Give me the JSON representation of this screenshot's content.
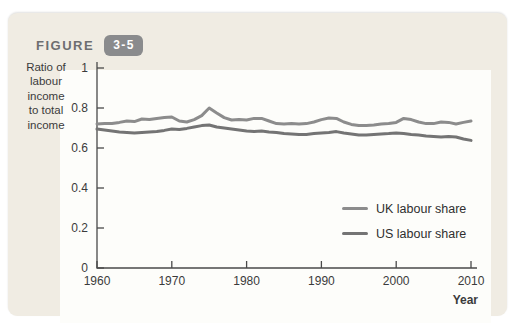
{
  "figure": {
    "label": "FIGURE",
    "number": "3-5"
  },
  "colors": {
    "card_bg": "#f0ece3",
    "panel_bg": "#fdfdfa",
    "badge_bg": "#8a8b8d",
    "badge_text": "#ffffff",
    "figure_label": "#6d6e70",
    "axis": "#4a4a4a",
    "text": "#3b3b3b",
    "uk_line": "#8c8c8c",
    "us_line": "#747474"
  },
  "chart_data": {
    "type": "line",
    "title": "",
    "ylabel": "Ratio of labour income to total income",
    "ylabel_lines": [
      "Ratio of",
      "labour",
      "income",
      "to total",
      "income"
    ],
    "xlabel": "Year",
    "xlim": [
      1960,
      2010
    ],
    "ylim": [
      0,
      1
    ],
    "xticks": [
      1960,
      1970,
      1980,
      1990,
      2000,
      2010
    ],
    "yticks": [
      0,
      0.2,
      0.4,
      0.6,
      0.8,
      1
    ],
    "ytick_labels": [
      "0",
      "0.2",
      "0.4",
      "0.6",
      "0.8",
      "1"
    ],
    "grid": false,
    "legend_position": "inside-right",
    "x": [
      1960,
      1961,
      1962,
      1963,
      1964,
      1965,
      1966,
      1967,
      1968,
      1969,
      1970,
      1971,
      1972,
      1973,
      1974,
      1975,
      1976,
      1977,
      1978,
      1979,
      1980,
      1981,
      1982,
      1983,
      1984,
      1985,
      1986,
      1987,
      1988,
      1989,
      1990,
      1991,
      1992,
      1993,
      1994,
      1995,
      1996,
      1997,
      1998,
      1999,
      2000,
      2001,
      2002,
      2003,
      2004,
      2005,
      2006,
      2007,
      2008,
      2009,
      2010
    ],
    "series": [
      {
        "name": "UK labour share",
        "color_key": "uk_line",
        "values": [
          0.72,
          0.722,
          0.722,
          0.728,
          0.735,
          0.732,
          0.745,
          0.742,
          0.748,
          0.752,
          0.755,
          0.735,
          0.73,
          0.742,
          0.762,
          0.8,
          0.775,
          0.752,
          0.74,
          0.742,
          0.74,
          0.748,
          0.748,
          0.735,
          0.722,
          0.72,
          0.722,
          0.72,
          0.722,
          0.73,
          0.742,
          0.75,
          0.748,
          0.73,
          0.718,
          0.712,
          0.712,
          0.715,
          0.72,
          0.722,
          0.728,
          0.748,
          0.742,
          0.73,
          0.722,
          0.722,
          0.73,
          0.728,
          0.72,
          0.728,
          0.735
        ]
      },
      {
        "name": "US labour share",
        "color_key": "us_line",
        "values": [
          0.695,
          0.69,
          0.685,
          0.68,
          0.678,
          0.675,
          0.678,
          0.68,
          0.682,
          0.688,
          0.695,
          0.692,
          0.698,
          0.705,
          0.712,
          0.715,
          0.705,
          0.7,
          0.695,
          0.69,
          0.685,
          0.682,
          0.685,
          0.68,
          0.678,
          0.672,
          0.67,
          0.668,
          0.668,
          0.672,
          0.675,
          0.678,
          0.682,
          0.675,
          0.67,
          0.665,
          0.665,
          0.668,
          0.67,
          0.672,
          0.675,
          0.672,
          0.668,
          0.665,
          0.66,
          0.658,
          0.655,
          0.658,
          0.655,
          0.645,
          0.638
        ]
      }
    ]
  }
}
